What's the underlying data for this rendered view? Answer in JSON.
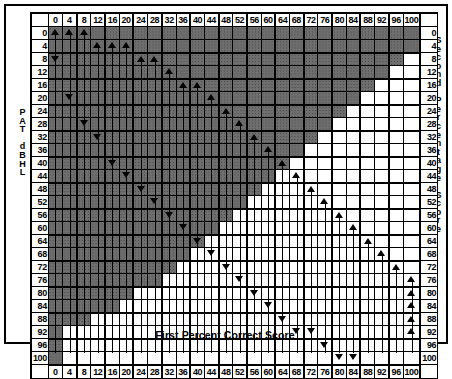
{
  "chart_data": {
    "type": "heatmap",
    "title": "",
    "xlabel": "First Percent Correct Score",
    "ylabel": "PAT dB HL",
    "ylabel_right": "Second Percentage Score",
    "xlabel_right_text": "Second Percentage Score",
    "tick_step": 4,
    "categories": [
      0,
      4,
      8,
      12,
      16,
      20,
      24,
      28,
      32,
      36,
      40,
      44,
      48,
      52,
      56,
      60,
      64,
      68,
      72,
      76,
      80,
      84,
      88,
      92,
      96,
      100
    ],
    "row_labels": [
      0,
      4,
      8,
      12,
      16,
      20,
      24,
      28,
      32,
      36,
      40,
      44,
      48,
      52,
      56,
      60,
      64,
      68,
      72,
      76,
      80,
      84,
      88,
      92,
      96,
      100
    ],
    "legend": [],
    "grid": true,
    "shaded_row_extent": [
      25,
      25,
      24,
      23,
      22,
      21,
      20,
      19,
      18,
      17,
      16,
      15,
      14,
      13,
      12,
      11,
      10,
      9,
      8,
      7,
      5,
      4,
      2,
      0,
      0,
      0
    ],
    "shaded_row_extent_note": "For row i (0-based), columns 0..extent are shaded; negative/zero means little or no shading.",
    "up_arrows": [
      {
        "row": 0,
        "cols": [
          0,
          1,
          2
        ]
      },
      {
        "row": 1,
        "cols": [
          3,
          4,
          5
        ]
      },
      {
        "row": 2,
        "cols": [
          6,
          7
        ]
      },
      {
        "row": 3,
        "cols": [
          8
        ]
      },
      {
        "row": 4,
        "cols": [
          9,
          10
        ]
      },
      {
        "row": 5,
        "cols": [
          11
        ]
      },
      {
        "row": 6,
        "cols": [
          12
        ]
      },
      {
        "row": 7,
        "cols": [
          13
        ]
      },
      {
        "row": 8,
        "cols": [
          14
        ]
      },
      {
        "row": 9,
        "cols": [
          15
        ]
      },
      {
        "row": 10,
        "cols": [
          16
        ]
      },
      {
        "row": 11,
        "cols": [
          17
        ]
      },
      {
        "row": 12,
        "cols": [
          18
        ]
      },
      {
        "row": 13,
        "cols": [
          19
        ]
      },
      {
        "row": 14,
        "cols": [
          20
        ]
      },
      {
        "row": 15,
        "cols": [
          21
        ]
      },
      {
        "row": 16,
        "cols": [
          22
        ]
      },
      {
        "row": 17,
        "cols": [
          23
        ]
      },
      {
        "row": 18,
        "cols": [
          24
        ]
      },
      {
        "row": 19,
        "cols": [
          25
        ]
      },
      {
        "row": 20,
        "cols": [
          25
        ]
      },
      {
        "row": 21,
        "cols": [
          25
        ]
      },
      {
        "row": 22,
        "cols": [
          25
        ]
      },
      {
        "row": 23,
        "cols": [
          25
        ]
      }
    ],
    "down_arrows": [
      {
        "row": 2,
        "cols": [
          0
        ]
      },
      {
        "row": 5,
        "cols": [
          1
        ]
      },
      {
        "row": 7,
        "cols": [
          2
        ]
      },
      {
        "row": 8,
        "cols": [
          3
        ]
      },
      {
        "row": 10,
        "cols": [
          4
        ]
      },
      {
        "row": 11,
        "cols": [
          5
        ]
      },
      {
        "row": 12,
        "cols": [
          6
        ]
      },
      {
        "row": 13,
        "cols": [
          7
        ]
      },
      {
        "row": 14,
        "cols": [
          8
        ]
      },
      {
        "row": 15,
        "cols": [
          9
        ]
      },
      {
        "row": 16,
        "cols": [
          10
        ]
      },
      {
        "row": 17,
        "cols": [
          11
        ]
      },
      {
        "row": 18,
        "cols": [
          12
        ]
      },
      {
        "row": 19,
        "cols": [
          13
        ]
      },
      {
        "row": 20,
        "cols": [
          14
        ]
      },
      {
        "row": 21,
        "cols": [
          15
        ]
      },
      {
        "row": 22,
        "cols": [
          16
        ]
      },
      {
        "row": 23,
        "cols": [
          17,
          18
        ]
      },
      {
        "row": 24,
        "cols": [
          19
        ]
      },
      {
        "row": 25,
        "cols": [
          20,
          21
        ]
      },
      {
        "row": 26,
        "cols": [
          22,
          23,
          24
        ]
      },
      {
        "row": 27,
        "cols": [
          24,
          25
        ]
      }
    ]
  },
  "axis": {
    "left_label_chars": [
      "P",
      "A",
      "T",
      "",
      "d",
      "B",
      "H",
      "L"
    ],
    "right_label_chars": [
      "S",
      "e",
      "c",
      "o",
      "n",
      "d",
      "",
      "P",
      "e",
      "r",
      "c",
      "e",
      "n",
      "t",
      "a",
      "g",
      "e",
      "",
      "S",
      "c",
      "o",
      "r",
      "e"
    ],
    "bottom_label": "First Percent Correct Score"
  },
  "colors": {
    "shaded": "#6e6e6e",
    "unshaded": "#ffffff",
    "grid_line": "#000000",
    "arrow": "#000000"
  }
}
